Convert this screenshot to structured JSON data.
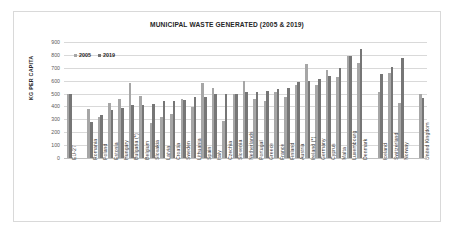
{
  "chart_data": {
    "type": "bar",
    "title": "MUNICIPAL WASTE GENERATED (2005 & 2019)",
    "xlabel": "",
    "ylabel": "KG PER CAPITA",
    "ylim": [
      0,
      900
    ],
    "ytick_step": 100,
    "yticks": [
      "900",
      "800",
      "700",
      "600",
      "500",
      "400",
      "300",
      "200",
      "100",
      "0"
    ],
    "grid": true,
    "legend_position": "top-left",
    "colors": {
      "series_2005": "#a6a6a6",
      "series_2019": "#767676",
      "gridline": "#d9d9d9",
      "frame": "#d9d9d9",
      "title_text": "#262626",
      "tick_text": "#595959"
    },
    "categories": [
      "EU-27",
      "",
      "Romania",
      "Poland",
      "Estonia",
      "Hungary",
      "Bulgaria (*)",
      "Belgium",
      "Slovakia",
      "Latvia",
      "Croatia",
      "Sweden",
      "Lithuania",
      "Spain",
      "Italy",
      "Czechia",
      "Slovenia",
      "Netherlands",
      "Portugal",
      "Greece",
      "France",
      "Finland",
      "Austria",
      "Ireland (*)",
      "Germany",
      "Cyprus",
      "Malta",
      "Luxembourg",
      "Denmark",
      "",
      "Iceland",
      "Switzerland",
      "Norway",
      "",
      "United Kingdom"
    ],
    "series": [
      {
        "name": "2005",
        "values": [
          500,
          null,
          380,
          320,
          430,
          460,
          585,
          480,
          270,
          320,
          340,
          455,
          395,
          585,
          545,
          290,
          500,
          600,
          455,
          440,
          515,
          470,
          570,
          730,
          565,
          685,
          625,
          790,
          735,
          null,
          515,
          660,
          425,
          null,
          500
        ]
      },
      {
        "name": "2019",
        "values": [
          500,
          null,
          280,
          335,
          370,
          385,
          410,
          415,
          420,
          440,
          445,
          450,
          470,
          475,
          500,
          500,
          500,
          510,
          515,
          520,
          535,
          545,
          590,
          600,
          610,
          640,
          695,
          790,
          845,
          null,
          655,
          705,
          775,
          null,
          465
        ]
      }
    ]
  },
  "legend": {
    "entries": [
      {
        "label": "2005",
        "color": "#a6a6a6"
      },
      {
        "label": "2019",
        "color": "#767676"
      }
    ]
  }
}
